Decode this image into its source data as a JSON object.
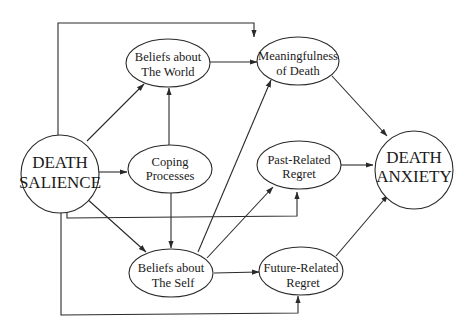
{
  "diagram": {
    "type": "path-model",
    "nodes": {
      "death_salience": {
        "line1": "DEATH",
        "line2": "SALIENCE"
      },
      "beliefs_world": {
        "line1": "Beliefs about",
        "line2": "The World"
      },
      "coping": {
        "line1": "Coping",
        "line2": "Processes"
      },
      "beliefs_self": {
        "line1": "Beliefs about",
        "line2": "The Self"
      },
      "meaningfulness": {
        "line1": "Meaningfulness",
        "line2": "of Death"
      },
      "past_regret": {
        "line1": "Past-Related",
        "line2": "Regret"
      },
      "future_regret": {
        "line1": "Future-Related",
        "line2": "Regret"
      },
      "death_anxiety": {
        "line1": "DEATH",
        "line2": "ANXIETY"
      }
    },
    "edges": [
      {
        "from": "DEATH SALIENCE",
        "to": "Beliefs about The World"
      },
      {
        "from": "DEATH SALIENCE",
        "to": "Coping Processes"
      },
      {
        "from": "DEATH SALIENCE",
        "to": "Beliefs about The Self"
      },
      {
        "from": "DEATH SALIENCE",
        "to": "Meaningfulness of Death"
      },
      {
        "from": "DEATH SALIENCE",
        "to": "Past-Related Regret"
      },
      {
        "from": "DEATH SALIENCE",
        "to": "Future-Related Regret"
      },
      {
        "from": "Coping Processes",
        "to": "Beliefs about The World"
      },
      {
        "from": "Coping Processes",
        "to": "Beliefs about The Self"
      },
      {
        "from": "Beliefs about The World",
        "to": "Meaningfulness of Death"
      },
      {
        "from": "Beliefs about The Self",
        "to": "Meaningfulness of Death"
      },
      {
        "from": "Beliefs about The Self",
        "to": "Past-Related Regret"
      },
      {
        "from": "Beliefs about The Self",
        "to": "Future-Related Regret"
      },
      {
        "from": "Meaningfulness of Death",
        "to": "DEATH ANXIETY"
      },
      {
        "from": "Past-Related Regret",
        "to": "DEATH ANXIETY"
      },
      {
        "from": "Future-Related Regret",
        "to": "DEATH ANXIETY"
      }
    ],
    "colors": {
      "stroke": "#2a2a2a",
      "text": "#1a1a1a",
      "background": "#ffffff"
    }
  }
}
